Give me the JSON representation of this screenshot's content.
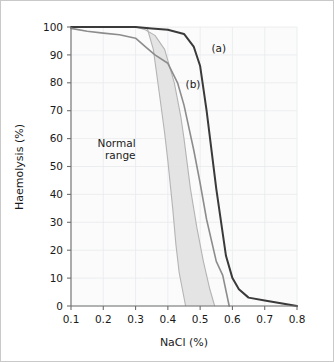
{
  "figure": {
    "background_color": "#ffffff",
    "frame_color": "#c9c9c9",
    "plot_background_color": "#fbfbfb",
    "grid_color": "#e8eaec",
    "axis_color": "#6e6e6e"
  },
  "chart_data": {
    "type": "line",
    "title": "",
    "subtitle": "",
    "xlabel": "NaCl (%)",
    "ylabel": "Haemolysis (%)",
    "xlim": [
      0.1,
      0.8
    ],
    "ylim": [
      0,
      100
    ],
    "xticks": [
      "0.1",
      "0.2",
      "0.3",
      "0.4",
      "0.5",
      "0.6",
      "0.7",
      "0.8"
    ],
    "xtick_values": [
      0.1,
      0.2,
      0.3,
      0.4,
      0.5,
      0.6,
      0.7,
      0.8
    ],
    "yticks": [
      "0",
      "10",
      "20",
      "30",
      "40",
      "50",
      "60",
      "70",
      "80",
      "90",
      "100"
    ],
    "ytick_values": [
      0,
      10,
      20,
      30,
      40,
      50,
      60,
      70,
      80,
      90,
      100
    ],
    "grid": true,
    "legend_position": "inline-annotations",
    "series": [
      {
        "name": "(a)",
        "label": "(a)",
        "color": "#3a3a3a",
        "line_width": 2.0,
        "x": [
          0.1,
          0.15,
          0.2,
          0.25,
          0.3,
          0.35,
          0.4,
          0.45,
          0.48,
          0.5,
          0.52,
          0.55,
          0.58,
          0.6,
          0.62,
          0.65,
          0.7,
          0.75,
          0.8
        ],
        "y": [
          100,
          100,
          100,
          100,
          100,
          99.5,
          99,
          97.5,
          93,
          86,
          70,
          42,
          18,
          10,
          6,
          3,
          2,
          1,
          0
        ]
      },
      {
        "name": "(b)",
        "label": "(b)",
        "color": "#8c8c8c",
        "line_width": 1.6,
        "x": [
          0.1,
          0.15,
          0.2,
          0.25,
          0.3,
          0.33,
          0.36,
          0.4,
          0.43,
          0.45,
          0.48,
          0.5,
          0.52,
          0.55,
          0.57,
          0.59
        ],
        "y": [
          99.5,
          98.5,
          97.8,
          97.2,
          96,
          93,
          90,
          87,
          80,
          72,
          56,
          44,
          31,
          16,
          11,
          0
        ]
      }
    ],
    "bands": [
      {
        "name": "Normal range",
        "label": "Normal range",
        "label_lines": [
          "Normal",
          "range"
        ],
        "fill_color": "#e3e3e3",
        "edge_color": "#b4b4b4",
        "upper_x": [
          0.3,
          0.33,
          0.36,
          0.39,
          0.42,
          0.44,
          0.45,
          0.47,
          0.49,
          0.51,
          0.53,
          0.545
        ],
        "upper_y": [
          100,
          99,
          97,
          92,
          80,
          68,
          60,
          42,
          28,
          16,
          6,
          0
        ],
        "lower_x": [
          0.335,
          0.355,
          0.375,
          0.39,
          0.4,
          0.415,
          0.425,
          0.435,
          0.445,
          0.455
        ],
        "lower_y": [
          100,
          92,
          75,
          62,
          52,
          35,
          22,
          12,
          6,
          0
        ]
      }
    ],
    "annotations": [
      {
        "text": "(a)",
        "x": 0.535,
        "y": 91
      },
      {
        "text": "(b)",
        "x": 0.455,
        "y": 78
      },
      {
        "text": "Normal range",
        "x": 0.3,
        "y": 57
      }
    ]
  }
}
